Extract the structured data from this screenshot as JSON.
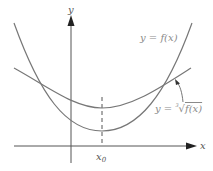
{
  "diagram": {
    "axes": {
      "x_label": "x",
      "y_label": "y",
      "x0_label": "x",
      "x0_subscript": "0"
    },
    "curves": [
      {
        "name": "f",
        "label_prefix": "y = ",
        "label_body": "f(x)"
      },
      {
        "name": "cube-root-f",
        "label_prefix": "y = ",
        "root_index": "3",
        "label_body": "f(x)"
      }
    ],
    "colors": {
      "curve": "#777777",
      "axis": "#444444",
      "label": "#8a8a8a"
    }
  }
}
